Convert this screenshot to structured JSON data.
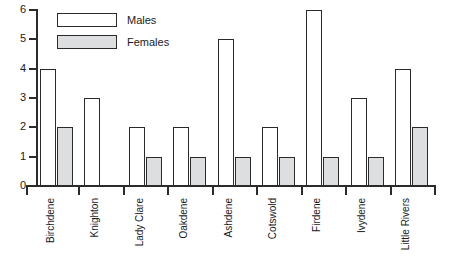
{
  "chart_data": {
    "type": "bar",
    "title": "",
    "subtitle": "",
    "xlabel": "",
    "ylabel": "",
    "categories": [
      "Birchdene",
      "Knighton",
      "Lady Clare",
      "Oakdene",
      "Ashdene",
      "Cotswold",
      "Firdene",
      "Ivydene",
      "Little Rivers"
    ],
    "series": [
      {
        "name": "Males",
        "values": [
          4,
          3,
          2,
          2,
          5,
          2,
          6,
          3,
          4
        ],
        "color": "#ffffff"
      },
      {
        "name": "Females",
        "values": [
          2,
          0,
          1,
          1,
          1,
          1,
          1,
          1,
          2
        ],
        "color": "#dcdee0"
      }
    ],
    "ylim": [
      0,
      6
    ],
    "ytick_labels": [
      "0",
      "1",
      "2",
      "3",
      "4",
      "5",
      "6"
    ],
    "yticks": [
      0,
      1,
      2,
      3,
      4,
      5,
      6
    ],
    "grid": false,
    "legend_position": "top-left-inside",
    "legend_entries": [
      "Males",
      "Females"
    ],
    "axis_color": "#2b2b2b",
    "bar_edge_color": "#2b2b2b"
  }
}
